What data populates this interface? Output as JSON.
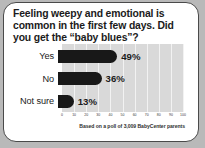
{
  "card": {
    "question": "Feeling weepy and emotional is common in the first few days. Did you get the “baby blues”?",
    "source_note": "Based on a poll of 3,009 BabyCenter parents"
  },
  "chart_data": {
    "type": "bar",
    "orientation": "horizontal",
    "title": "Feeling weepy and emotional is common in the first few days. Did you get the “baby blues”?",
    "categories": [
      "Yes",
      "No",
      "Not sure"
    ],
    "values": [
      49,
      36,
      13
    ],
    "value_labels": [
      "49%",
      "36%",
      "13%"
    ],
    "xlabel": "",
    "ylabel": "",
    "xlim": [
      0,
      100
    ],
    "xticks": [
      0,
      10,
      20,
      30,
      40,
      50,
      60,
      70,
      80,
      90,
      100
    ],
    "xtick_labels": [
      "0",
      "10",
      "20",
      "30",
      "40",
      "50",
      "60",
      "70",
      "80",
      "90",
      "100"
    ],
    "grid": true,
    "legend": false,
    "annotation": "Based on a poll of 3,009 BabyCenter parents",
    "colors": {
      "bar": "#181818",
      "plot_background": "#d9d9d9",
      "gridline": "#f2f2f2",
      "card_background": "#ffffff",
      "card_border": "#4a4a4a",
      "text": "#1b1b1b"
    }
  }
}
